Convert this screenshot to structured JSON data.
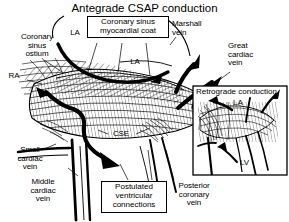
{
  "figure": {
    "title": "Antegrade CSAP conduction",
    "width": 289,
    "height": 222,
    "background": "#ffffff",
    "ink_color": "#000000"
  },
  "labels": {
    "coronary_sinus_ostium": "Coronary\nsinus\nostium",
    "la_top_left": "LA",
    "la_center": "LA",
    "ra": "RA",
    "marshall_vein": "Marshall\nvein",
    "great_cardiac_vein": "Great\ncardiac\nvein",
    "cse": "CSE",
    "small_cardiac_vein": "Small\ncardiac\nvein",
    "middle_cardiac_vein": "Middle\ncardiac\nvein",
    "posterior_coronary_vein": "Posterior\ncoronary\nvein"
  },
  "boxes": {
    "myocardial_coat": "Coronary sinus\nmyocardial coat",
    "postulated_connections": "Postulated\nventricular\nconnections"
  },
  "inset": {
    "title": "Retrograde conduction",
    "la": "LA",
    "lv": "LV"
  },
  "icons": {
    "antegrade_arrow": "thick-curved-arrow-icon",
    "marshall_arrow": "thick-arrow-up-right-icon",
    "gcv_arrow": "thick-arrow-up-right-icon",
    "ventricular_arrow": "thick-arrow-down-right-icon",
    "inset_la_arrow": "arrow-up-left-icon",
    "inset_lv_arrow": "arrow-up-left-icon",
    "inset_right_arrow": "arrow-up-right-icon"
  }
}
